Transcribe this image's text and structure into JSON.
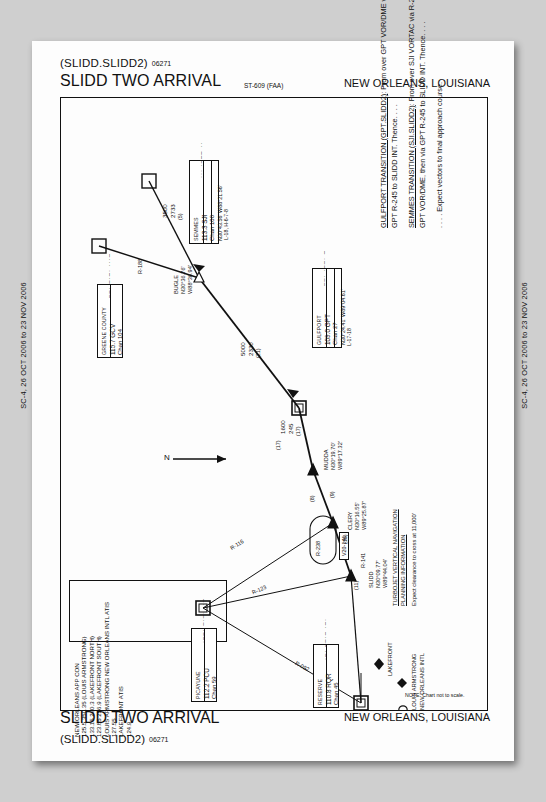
{
  "header": {
    "ident": "(SLIDD.SLIDD2)",
    "amendment": "06271",
    "title": "SLIDD TWO ARRIVAL",
    "st_number": "ST-609 (FAA)",
    "city_state": "NEW ORLEANS, LOUISIANA"
  },
  "footer": {
    "title": "SLIDD TWO ARRIVAL",
    "ident": "(SLIDD.SLIDD2)",
    "amendment": "06271",
    "city_state": "NEW ORLEANS, LOUISIANA"
  },
  "side_bars": {
    "left": "SC-4, 26 OCT 2006 to 23 NOV 2006",
    "right": "SC-4, 26 OCT 2006 to 23 NOV 2006"
  },
  "transitions": [
    {
      "name": "GULFPORT TRANSITION (GPT.SLIDD2)",
      "text": ": From over GPT VOR/DME via GPT R-245 to SLIDD INT.  Thence. . . ."
    },
    {
      "name": "SEMMES TRANSITION (SJI.SLIDD2)",
      "text": ": From over SJI VORTAC via R-238 to GPT VOR/DME, then via GPT R-245 to SLIDD INT.  Thence. . . ."
    },
    {
      "name": "",
      "text": ". . . . Expect vectors to final approach course."
    }
  ],
  "communications": {
    "lines": [
      "NEW ORLEANS APP CON",
      "125.5  350.35  (LOUIS ARMSTRONG)",
      "133.15  290.3  (LAKEFRONT NORTH)",
      "123.85  256.9  (LAKEFRONT SOUTH)",
      "LOUIS ARMSTRONG NEW ORLEANS INTL ATIS",
      "127.55",
      "LAKEFRONT ATIS",
      "124.9"
    ]
  },
  "navaids": [
    {
      "name": "SEMMES",
      "freq": "113.3 SJI",
      "chan": "Chan 100",
      "coord": "N30°43.56'  W88°21.56'",
      "lowalt": "L-18, H-6-7-8"
    },
    {
      "name": "GREENE COUNTY",
      "freq": "115.7 GCV",
      "chan": "Chan 104",
      "coord": "",
      "lowalt": ""
    },
    {
      "name": "GULFPORT",
      "freq": "109.0 GPT",
      "chan": "Chan 27",
      "coord": "N30°24.41'  W89°04.61'",
      "lowalt": "L-17-18"
    },
    {
      "name": "PICAYUNE",
      "freq": "112.2 PCU",
      "chan": "Chan 59",
      "coord": "",
      "lowalt": ""
    },
    {
      "name": "RESERVE",
      "freq": "110.8 RQR",
      "chan": "Chan 45",
      "coord": "",
      "lowalt": ""
    }
  ],
  "waypoints": [
    {
      "name": "BUGLE",
      "lat": "N30°36.76'",
      "lon": "W88°36.94'"
    },
    {
      "name": "MUDDA",
      "lat": "N30°19.70'",
      "lon": "W89°17.32'"
    },
    {
      "name": "CLERY",
      "lat": "N30°16.55'",
      "lon": "W89°25.87'"
    },
    {
      "name": "SLIDD",
      "lat": "N30°09.77'",
      "lon": "W89°44.04'"
    }
  ],
  "route_labels": [
    {
      "text": "3500",
      "sub": "2730"
    },
    {
      "text": "2733",
      "sub": "(5)"
    },
    {
      "text": "R-188",
      "sub": ""
    },
    {
      "text": "5000",
      "sub": "2330"
    },
    {
      "text": "2330",
      "sub": "(21)"
    },
    {
      "text": "1600",
      "sub": "245"
    },
    {
      "text": "245",
      "sub": "(17)"
    },
    {
      "text": "R-116",
      "sub": ""
    },
    {
      "text": "R-123",
      "sub": ""
    },
    {
      "text": "R-092",
      "sub": ""
    },
    {
      "text": "R-238",
      "sub": ""
    },
    {
      "text": "R-141",
      "sub": ""
    },
    {
      "text": "V20-141",
      "sub": ""
    }
  ],
  "segment_markers": [
    {
      "label": "(8)"
    },
    {
      "label": "(9)"
    },
    {
      "label": "(16)"
    },
    {
      "label": "(11)"
    },
    {
      "label": "(17)"
    }
  ],
  "vnav_note": {
    "title_line1": "TURBOJET VERTICAL NAVIGATION",
    "title_line2": "PLANNING INFORMATION",
    "body": "Expect clearance to cross at 11,000'"
  },
  "airport_label": {
    "line1": "LOUIS ARMSTRONG",
    "line2": "NEW ORLEANS INTL"
  },
  "lakefront_label": "LAKEFRONT",
  "scale_note": "NOTE:  Chart not to scale.",
  "north_label": "N"
}
